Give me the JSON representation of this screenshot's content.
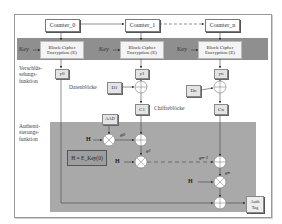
{
  "diagram": {
    "counters": [
      {
        "label": "Counter_0"
      },
      {
        "label": "Counter_1"
      },
      {
        "label": "Counter_n"
      }
    ],
    "ciphers": [
      {
        "line1": "Block Cipher",
        "line2": "Encryption (E)",
        "key": "Key"
      },
      {
        "line1": "Block Cipher",
        "line2": "Encryption (E)",
        "key": "Key"
      },
      {
        "line1": "Block Cipher",
        "line2": "Encryption (E)",
        "key": "Key"
      }
    ],
    "outputs": [
      "y0",
      "y1",
      "yn"
    ],
    "data_blocks": [
      "D1",
      "Dn"
    ],
    "cipher_blocks": [
      "C1",
      "Cn"
    ],
    "labels": {
      "encryption_function": [
        "Verschlüs-",
        "selungs-",
        "funktion"
      ],
      "auth_function": [
        "Authenti-",
        "sierungs-",
        "funktion"
      ],
      "data_blocks": "Datenblöcke",
      "cipher_blocks": "Chiffreblöcke",
      "aad": "AAD",
      "h_definition": "H = E_Key(0)",
      "h": "H",
      "g0": "g0",
      "g1": "g1",
      "gn_minus_1": "gn-1",
      "gn": "gn",
      "auth_tag_line1": "Auth",
      "auth_tag_line2": "Tag"
    },
    "colors": {
      "band": "#8f8f8f",
      "auth_area": "#a9a9a9",
      "frame": "#9a9a9a"
    }
  }
}
